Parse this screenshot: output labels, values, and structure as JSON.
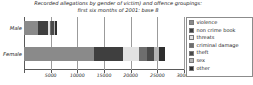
{
  "chart_data": {
    "type": "bar",
    "orientation": "horizontal",
    "stacked": true,
    "title": "Recorded allegations by gender of victim) and offence groupings:",
    "subtitle": "first six months of 2001: base 8",
    "title_lines": [
      "Recorded allegations by gender of victim) and offence groupings:",
      "first six months of 2001: base 8"
    ],
    "xlabel": "",
    "ylabel": "",
    "categories": [
      "Male",
      "Female"
    ],
    "xlim": [
      0,
      30000
    ],
    "xticks": [
      0,
      5000,
      10000,
      15000,
      20000,
      25000,
      30000
    ],
    "xtick_labels": [
      "",
      "5000",
      "10000",
      "15000",
      "20000",
      "25000",
      "30000"
    ],
    "grid": true,
    "legend_position": "right",
    "series": [
      {
        "name": "violence",
        "color": "#8a8a8a",
        "values": [
          2600,
          13100
        ]
      },
      {
        "name": "non crime book",
        "color": "#3f3f3f",
        "values": [
          1900,
          5400
        ]
      },
      {
        "name": "threats",
        "color": "#e2e2e2",
        "values": [
          400,
          3000
        ]
      },
      {
        "name": "criminal damage",
        "color": "#6e6e6e",
        "values": [
          200,
          1500
        ]
      },
      {
        "name": "theft",
        "color": "#4a4a4a",
        "values": [
          550,
          1400
        ]
      },
      {
        "name": "sex",
        "color": "#b4b4b4",
        "values": [
          250,
          900
        ]
      },
      {
        "name": "other",
        "color": "#2e2e2e",
        "values": [
          300,
          1200
        ]
      }
    ],
    "totals": [
      6200,
      26500
    ]
  },
  "legend": {
    "items": [
      {
        "label": "violence",
        "swatch": "#8a8a8a"
      },
      {
        "label": "non crime book",
        "swatch": "#3f3f3f"
      },
      {
        "label": "threats",
        "swatch": "#e2e2e2"
      },
      {
        "label": "criminal damage",
        "swatch": "#6e6e6e"
      },
      {
        "label": "theft",
        "swatch": "#4a4a4a"
      },
      {
        "label": "sex",
        "swatch": "#b4b4b4"
      },
      {
        "label": "other",
        "swatch": "#2e2e2e"
      }
    ]
  },
  "colors": {
    "background": "#ffffff",
    "axis": "#5a5a5a",
    "grid": "#9b9b9b",
    "text": "#1e1e1e",
    "legend_border": "#8c8c8c"
  }
}
